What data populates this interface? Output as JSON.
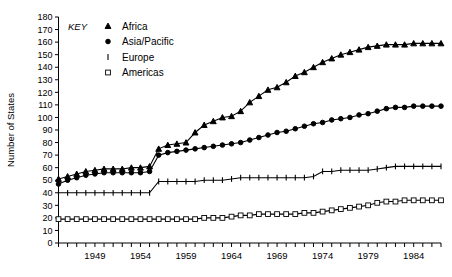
{
  "chart_data": {
    "type": "line",
    "title": "",
    "subtitle": "",
    "xlabel": "",
    "ylabel": "Number of States",
    "xlim": [
      1945,
      1987
    ],
    "ylim": [
      0,
      180
    ],
    "ytick_step": 10,
    "yticks": [
      0,
      10,
      20,
      30,
      40,
      50,
      60,
      70,
      80,
      90,
      100,
      110,
      120,
      130,
      140,
      150,
      160,
      170,
      180
    ],
    "xticks_labeled": [
      1949,
      1954,
      1959,
      1964,
      1969,
      1974,
      1979,
      1984
    ],
    "xticks_all_years": [
      1945,
      1946,
      1947,
      1948,
      1949,
      1950,
      1951,
      1952,
      1953,
      1954,
      1955,
      1956,
      1957,
      1958,
      1959,
      1960,
      1961,
      1962,
      1963,
      1964,
      1965,
      1966,
      1967,
      1968,
      1969,
      1970,
      1971,
      1972,
      1973,
      1974,
      1975,
      1976,
      1977,
      1978,
      1979,
      1980,
      1981,
      1982,
      1983,
      1984,
      1985,
      1986,
      1987
    ],
    "grid": false,
    "legend_position": "top-left-inside",
    "legend_title": "KEY",
    "x": [
      1945,
      1946,
      1947,
      1948,
      1949,
      1950,
      1951,
      1952,
      1953,
      1954,
      1955,
      1956,
      1957,
      1958,
      1959,
      1960,
      1961,
      1962,
      1963,
      1964,
      1965,
      1966,
      1967,
      1968,
      1969,
      1970,
      1971,
      1972,
      1973,
      1974,
      1975,
      1976,
      1977,
      1978,
      1979,
      1980,
      1981,
      1982,
      1983,
      1984,
      1985,
      1986,
      1987
    ],
    "series": [
      {
        "name": "Africa",
        "marker": "triangle",
        "values": [
          51,
          53,
          55,
          57,
          58,
          59,
          59,
          59,
          60,
          60,
          61,
          75,
          78,
          79,
          80,
          88,
          94,
          97,
          100,
          101,
          105,
          112,
          117,
          122,
          124,
          128,
          133,
          136,
          140,
          144,
          147,
          150,
          152,
          154,
          156,
          157,
          158,
          158,
          158,
          159,
          159,
          159,
          159
        ]
      },
      {
        "name": "Asia/Pacific",
        "marker": "circle",
        "values": [
          47,
          50,
          52,
          54,
          55,
          56,
          56,
          56,
          56,
          56,
          57,
          70,
          72,
          73,
          74,
          75,
          76,
          77,
          78,
          79,
          80,
          82,
          84,
          86,
          88,
          89,
          91,
          93,
          95,
          96,
          98,
          99,
          100,
          102,
          103,
          105,
          107,
          108,
          108,
          109,
          109,
          109,
          109
        ]
      },
      {
        "name": "Europe",
        "marker": "bar",
        "values": [
          40,
          40,
          40,
          40,
          40,
          40,
          40,
          40,
          40,
          40,
          40,
          49,
          49,
          49,
          49,
          49,
          50,
          50,
          50,
          51,
          52,
          52,
          52,
          52,
          52,
          52,
          52,
          52,
          53,
          57,
          57,
          58,
          58,
          58,
          58,
          59,
          60,
          61,
          61,
          61,
          61,
          61,
          61
        ]
      },
      {
        "name": "Americas",
        "marker": "square-open",
        "values": [
          19,
          19,
          19,
          19,
          19,
          19,
          19,
          19,
          19,
          19,
          19,
          19,
          19,
          19,
          19,
          19,
          20,
          20,
          20,
          21,
          22,
          22,
          23,
          23,
          23,
          23,
          23,
          24,
          24,
          25,
          26,
          27,
          28,
          29,
          30,
          32,
          33,
          33,
          34,
          34,
          34,
          34,
          34
        ]
      }
    ]
  },
  "legend": {
    "title": "KEY",
    "entries": [
      {
        "label": "Africa",
        "marker": "triangle"
      },
      {
        "label": "Asia/Pacific",
        "marker": "circle"
      },
      {
        "label": "Europe",
        "marker": "bar"
      },
      {
        "label": "Americas",
        "marker": "square-open"
      }
    ]
  },
  "axes": {
    "y_axis_label": "Number of States"
  },
  "colors": {
    "ink": "#000000",
    "background": "#ffffff"
  }
}
